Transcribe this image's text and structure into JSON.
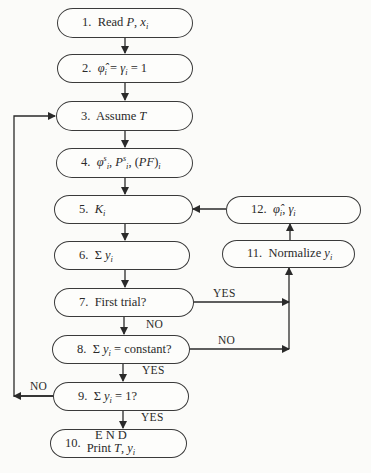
{
  "diagram": {
    "type": "flowchart",
    "nodes": [
      {
        "id": 1,
        "num": "1.",
        "text": "Read P, x_i"
      },
      {
        "id": 2,
        "num": "2.",
        "text": "φ̂_i = γ_i = 1"
      },
      {
        "id": 3,
        "num": "3.",
        "text": "Assume T"
      },
      {
        "id": 4,
        "num": "4.",
        "text": "φ_i^s, P_i^s, (PF)_i"
      },
      {
        "id": 5,
        "num": "5.",
        "text": "K_i"
      },
      {
        "id": 6,
        "num": "6.",
        "text": "Σ y_i"
      },
      {
        "id": 7,
        "num": "7.",
        "text": "First trial?"
      },
      {
        "id": 8,
        "num": "8.",
        "text": "Σ y_i = constant?"
      },
      {
        "id": 9,
        "num": "9.",
        "text": "Σ y_i = 1?"
      },
      {
        "id": 10,
        "num": "10.",
        "text_line1": "E N D",
        "text_line2": "Print T, y_i"
      },
      {
        "id": 11,
        "num": "11.",
        "text": "Normalize y_i"
      },
      {
        "id": 12,
        "num": "12.",
        "text": "φ̂_i, γ_i"
      }
    ],
    "edges": [
      {
        "from": 1,
        "to": 2,
        "label": ""
      },
      {
        "from": 2,
        "to": 3,
        "label": ""
      },
      {
        "from": 3,
        "to": 4,
        "label": ""
      },
      {
        "from": 4,
        "to": 5,
        "label": ""
      },
      {
        "from": 5,
        "to": 6,
        "label": ""
      },
      {
        "from": 6,
        "to": 7,
        "label": ""
      },
      {
        "from": 7,
        "to": 11,
        "label": "YES"
      },
      {
        "from": 7,
        "to": 8,
        "label": "NO"
      },
      {
        "from": 8,
        "to": 11,
        "label": "NO"
      },
      {
        "from": 8,
        "to": 9,
        "label": "YES"
      },
      {
        "from": 9,
        "to": 3,
        "label": "NO"
      },
      {
        "from": 9,
        "to": 10,
        "label": "YES"
      },
      {
        "from": 11,
        "to": 12,
        "label": ""
      },
      {
        "from": 12,
        "to": 5,
        "label": ""
      }
    ],
    "labels": {
      "yes": "YES",
      "no": "NO"
    }
  }
}
